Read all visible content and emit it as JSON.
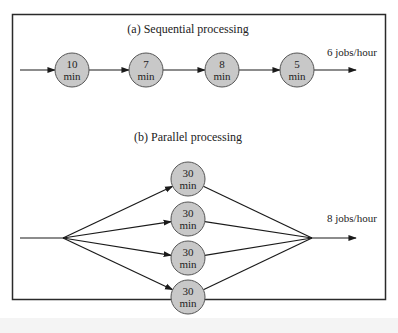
{
  "diagram": {
    "colors": {
      "border": "#2a2a2a",
      "node_fill": "#c8c8c8",
      "node_stroke": "#555555",
      "line": "#1a1a1a"
    },
    "sequential": {
      "title": "(a) Sequential processing",
      "rate_label": "6 jobs/hour",
      "nodes": [
        {
          "value": "10",
          "unit": "min"
        },
        {
          "value": "7",
          "unit": "min"
        },
        {
          "value": "8",
          "unit": "min"
        },
        {
          "value": "5",
          "unit": "min"
        }
      ]
    },
    "parallel": {
      "title": "(b) Parallel processing",
      "rate_label": "8 jobs/hour",
      "nodes": [
        {
          "value": "30",
          "unit": "min"
        },
        {
          "value": "30",
          "unit": "min"
        },
        {
          "value": "30",
          "unit": "min"
        },
        {
          "value": "30",
          "unit": "min"
        }
      ]
    }
  }
}
